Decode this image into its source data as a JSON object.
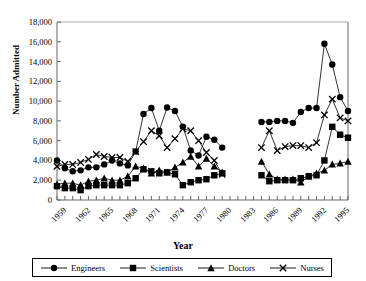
{
  "chart_data": {
    "type": "line",
    "title": "",
    "xlabel": "Year",
    "ylabel": "Number Admitted",
    "xlim": [
      1959,
      1996
    ],
    "ylim": [
      0,
      18000
    ],
    "ytick_step": 2000,
    "grid": false,
    "legend_position": "bottom",
    "x": [
      1959,
      1960,
      1961,
      1962,
      1963,
      1964,
      1965,
      1966,
      1967,
      1968,
      1969,
      1970,
      1971,
      1972,
      1973,
      1974,
      1975,
      1976,
      1977,
      1978,
      1979,
      1980,
      1983,
      1984,
      1985,
      1986,
      1987,
      1988,
      1989,
      1990,
      1991,
      1992,
      1993,
      1994,
      1995,
      1996
    ],
    "xtick_labels": [
      "1959",
      "1962",
      "1965",
      "1968",
      "1971",
      "1974",
      "1977",
      "1980",
      "1983",
      "1986",
      "1989",
      "1992",
      "1995"
    ],
    "ytick_labels": [
      "0",
      "2,000",
      "4,000",
      "6,000",
      "8,000",
      "10,000",
      "12,000",
      "14,000",
      "16,000",
      "18,000"
    ],
    "series": [
      {
        "name": "Engineers",
        "marker": "circle",
        "values": [
          4000,
          3200,
          2900,
          3000,
          3300,
          3300,
          3600,
          4000,
          3700,
          3500,
          4900,
          8700,
          9300,
          7000,
          9350,
          9000,
          7400,
          5000,
          4500,
          6400,
          6100,
          5300,
          null,
          null,
          7900,
          7900,
          8000,
          8000,
          7800,
          8900,
          9300,
          9300,
          15800,
          13700,
          10400,
          9000
        ]
      },
      {
        "name": "Scientists",
        "marker": "square",
        "values": [
          1400,
          1200,
          1200,
          1000,
          1400,
          1500,
          1500,
          1500,
          1500,
          1700,
          2200,
          3100,
          2900,
          2700,
          2800,
          2600,
          1500,
          1800,
          2000,
          2100,
          2500,
          2700,
          null,
          null,
          2500,
          1900,
          2000,
          2000,
          2000,
          2200,
          2400,
          2500,
          4000,
          7400,
          6600,
          6300
        ]
      },
      {
        "name": "Doctors",
        "marker": "triangle",
        "values": [
          1600,
          1700,
          1700,
          1500,
          1900,
          2000,
          2200,
          2000,
          2000,
          2400,
          3400,
          3200,
          2700,
          3000,
          2800,
          3300,
          3800,
          4400,
          3400,
          4200,
          3400,
          2800,
          null,
          null,
          3900,
          2600,
          2100,
          2100,
          2100,
          1800,
          2400,
          2700,
          3000,
          3600,
          3700,
          3900
        ]
      },
      {
        "name": "Nurses",
        "marker": "cross",
        "values": [
          3400,
          3600,
          3600,
          3800,
          4100,
          4600,
          4400,
          4300,
          4300,
          3900,
          4900,
          5900,
          7000,
          6500,
          5300,
          6200,
          7200,
          7000,
          6000,
          4800,
          4000,
          2600,
          null,
          null,
          5300,
          7000,
          5000,
          5400,
          5500,
          5500,
          5300,
          5800,
          8600,
          10200,
          8300,
          8000
        ]
      }
    ]
  },
  "legend": {
    "items": [
      {
        "label": "Engineers",
        "marker": "circle"
      },
      {
        "label": "Scientists",
        "marker": "square"
      },
      {
        "label": "Doctors",
        "marker": "triangle"
      },
      {
        "label": "Nurses",
        "marker": "cross"
      }
    ]
  }
}
